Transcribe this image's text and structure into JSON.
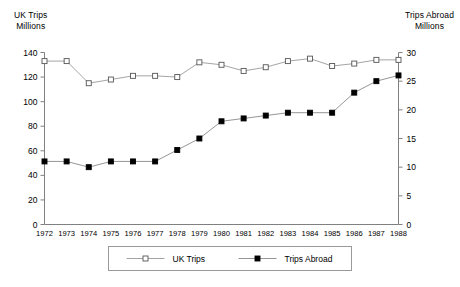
{
  "chart_data": {
    "type": "line",
    "title": "",
    "subtitle": "",
    "xlabel": "",
    "ylabel": "UK Trips Millions",
    "y2label": "Trips Abroad Millions",
    "left_axis": {
      "title_line1": "UK Trips",
      "title_line2": "Millions",
      "ticks": [
        0,
        20,
        40,
        60,
        80,
        100,
        120,
        140
      ],
      "ylim": [
        0,
        140
      ]
    },
    "right_axis": {
      "title_line1": "Trips Abroad",
      "title_line2": "Millions",
      "ticks": [
        0,
        5,
        10,
        15,
        20,
        25,
        30
      ],
      "ylim": [
        0,
        30
      ]
    },
    "grid": false,
    "legend_position": "bottom-center",
    "categories": [
      "1972",
      "1973",
      "1974",
      "1975",
      "1976",
      "1977",
      "1978",
      "1979",
      "1980",
      "1981",
      "1982",
      "1983",
      "1984",
      "1985",
      "1986",
      "1987",
      "1988"
    ],
    "series": [
      {
        "name": "UK Trips",
        "axis": "left",
        "marker": "open-square",
        "values": [
          133,
          133,
          115,
          118,
          121,
          121,
          120,
          132,
          130,
          125,
          128,
          133,
          135,
          129,
          131,
          134,
          134
        ]
      },
      {
        "name": "Trips Abroad",
        "axis": "right",
        "marker": "filled-square",
        "values": [
          11.0,
          11.0,
          10.0,
          11.0,
          11.0,
          11.0,
          13.0,
          15.0,
          18.0,
          18.5,
          19.0,
          19.5,
          19.5,
          19.5,
          23.0,
          25.0,
          26.0
        ]
      }
    ],
    "legend": [
      {
        "label": "UK Trips",
        "marker": "open-square"
      },
      {
        "label": "Trips Abroad",
        "marker": "filled-square"
      }
    ]
  }
}
